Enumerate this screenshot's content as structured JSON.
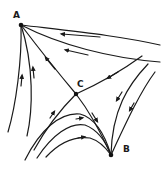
{
  "diagram": {
    "type": "flow-field / saddle-point streamline diagram",
    "nodes": [
      {
        "id": "A",
        "label": "A",
        "x": 21,
        "y": 25,
        "role": "sink (all curves converge)"
      },
      {
        "id": "B",
        "label": "B",
        "x": 111,
        "y": 155,
        "role": "sink (curves converge)"
      },
      {
        "id": "C",
        "label": "C",
        "x": 76,
        "y": 94,
        "role": "saddle point"
      }
    ],
    "labels": {
      "A": "A",
      "B": "B",
      "C": "C"
    },
    "colors": {
      "ink": "#1a1a1a",
      "background": "#ffffff"
    }
  }
}
